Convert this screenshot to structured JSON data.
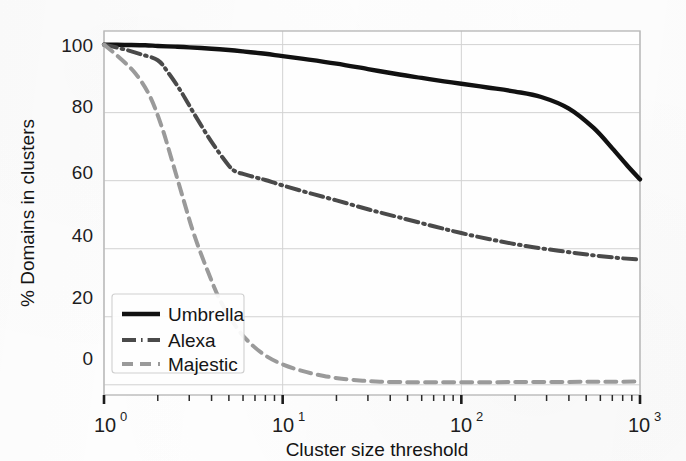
{
  "chart_data": {
    "type": "line",
    "title": "",
    "xlabel": "Cluster size threshold",
    "ylabel": "% Domains in clusters",
    "xscale": "log",
    "yscale": "linear",
    "xlim": [
      1,
      1000
    ],
    "ylim": [
      -3,
      104
    ],
    "grid": true,
    "legend_position": "lower left",
    "xtick_labels": [
      "10^0",
      "10^1",
      "10^2",
      "10^3"
    ],
    "xtick_values": [
      1,
      10,
      100,
      1000
    ],
    "ytick_labels": [
      "0",
      "20",
      "40",
      "60",
      "80",
      "100"
    ],
    "ytick_values": [
      0,
      20,
      40,
      60,
      80,
      100
    ],
    "series": [
      {
        "name": "Umbrella",
        "style": "solid",
        "color": "#111111",
        "x": [
          1,
          1.3,
          1.7,
          2,
          2.5,
          3,
          4,
          5,
          6,
          8,
          10,
          14,
          20,
          30,
          45,
          60,
          80,
          100,
          140,
          200,
          280,
          400,
          550,
          700,
          850,
          1000
        ],
        "y": [
          100,
          99.9,
          99.8,
          99.6,
          99.4,
          99.2,
          98.8,
          98.4,
          98,
          97.3,
          96.6,
          95.6,
          94.4,
          92.8,
          91.2,
          90.2,
          89.2,
          88.5,
          87.4,
          86.2,
          84.6,
          81.2,
          75.5,
          69.5,
          64.4,
          60.4
        ]
      },
      {
        "name": "Alexa",
        "style": "dashdot",
        "color": "#4a4a4a",
        "x": [
          1,
          1.3,
          1.6,
          2,
          2.3,
          2.7,
          3.2,
          4,
          5,
          5.5,
          6,
          7,
          8,
          10,
          14,
          20,
          30,
          45,
          70,
          100,
          150,
          230,
          350,
          520,
          750,
          1000
        ],
        "y": [
          100,
          98.6,
          97.2,
          95.4,
          91.6,
          86.2,
          79.6,
          71.4,
          64.4,
          62.6,
          62.0,
          61.0,
          60.2,
          58.6,
          56.4,
          54.2,
          51.6,
          49.2,
          46.6,
          44.6,
          42.6,
          40.8,
          39.4,
          38.2,
          37.3,
          36.8
        ]
      },
      {
        "name": "Majestic",
        "style": "dashed",
        "color": "#9a9a9a",
        "x": [
          1,
          1.2,
          1.5,
          1.8,
          2.1,
          2.4,
          2.8,
          3.2,
          3.8,
          4.5,
          5.5,
          6.5,
          8,
          10,
          13,
          17,
          22,
          28,
          35,
          45,
          60,
          100,
          200,
          400,
          700,
          1000
        ],
        "y": [
          100,
          96.5,
          91.5,
          85.0,
          76.0,
          66.0,
          54.0,
          44.0,
          33.5,
          24.5,
          17.0,
          12.5,
          8.6,
          6.0,
          4.0,
          2.6,
          1.7,
          1.2,
          0.9,
          0.8,
          0.75,
          0.75,
          0.8,
          0.85,
          0.9,
          0.95
        ]
      }
    ]
  },
  "legend": {
    "items": [
      {
        "label": "Umbrella"
      },
      {
        "label": "Alexa"
      },
      {
        "label": "Majestic"
      }
    ]
  },
  "axes": {
    "x_title": "Cluster size threshold",
    "y_title": "% Domains in clusters",
    "x_ticks": [
      {
        "base": "10",
        "exp": "0"
      },
      {
        "base": "10",
        "exp": "1"
      },
      {
        "base": "10",
        "exp": "2"
      },
      {
        "base": "10",
        "exp": "3"
      }
    ],
    "y_ticks": [
      "100",
      "80",
      "60",
      "40",
      "20",
      "0"
    ]
  },
  "colors": {
    "umbrella": "#111111",
    "alexa": "#4a4a4a",
    "majestic": "#9a9a9a",
    "grid": "#d2d2d2",
    "frame": "#b9b9b9",
    "background": "#fefefe"
  }
}
